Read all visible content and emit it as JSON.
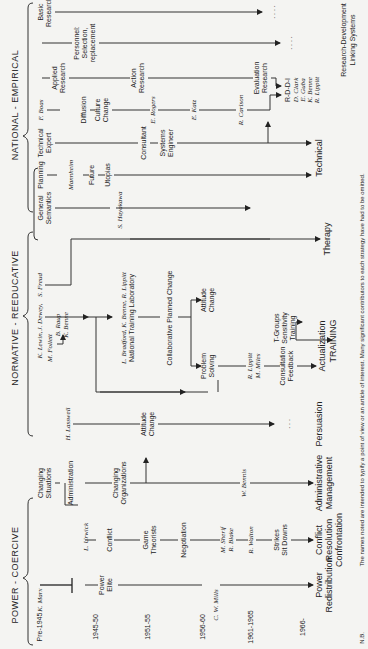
{
  "headings": {
    "power": "POWER - COERCIVE",
    "normative": "NORMATIVE - REEDUCATIVE",
    "national": "NATIONAL - EMPIRICAL"
  },
  "periods": [
    "Pre-1945",
    "1945-50",
    "1951-55",
    "1956-60",
    "1961-1965",
    "1966-"
  ],
  "power_coercive": {
    "k_marx": "K. Marx",
    "power_elite": [
      "Power",
      "Elite"
    ],
    "c_w_mills": "C. W. Mills",
    "power_redistribution": [
      "Power",
      "Redistribution"
    ],
    "conflict": "Conflict",
    "l_urwick": "L. Urwick",
    "game_theorists": [
      "Game",
      "Theorists"
    ],
    "negotiation": "Negotiation",
    "m_sherif": "M. Sherif",
    "r_blake": "R. Blake",
    "r_walton": "R. Walton",
    "strikes": [
      "Strikes",
      "Sit Downs"
    ],
    "conflict_resolution": [
      "Conflict",
      "Resolution",
      "Confrontation"
    ],
    "changing_situations": [
      "Changing",
      "Situations"
    ],
    "administration": "Administration",
    "changing_organizations": [
      "Changing",
      "Organizations"
    ],
    "w_bennis": "W. Bennis",
    "administrative_management": [
      "Administrative",
      "Management"
    ],
    "h_lasswell": "H. Lasswell",
    "attitude_change": [
      "Attitude",
      "Change"
    ],
    "persuasion": "Persuasion",
    "ellipsis": ". . ."
  },
  "normative_reeducative": {
    "k_lewin": "K. Lewin,",
    "j_dewey": "J. Dewey,",
    "s_freud": "S. Freud",
    "m_follett": "M. Follett",
    "b_raup": "B. Raup",
    "k_benne": "K. Benne",
    "ntl_names": "L. Bradford, K. Benne, R. Lippitt",
    "ntl": "National Training Laboratory",
    "collaborative": "Collaborative Planned Change",
    "attitude_change": [
      "Attitude",
      "Change"
    ],
    "problem_solving": [
      "Problem",
      "Solving"
    ],
    "r_lippitt": "R. Lippitt",
    "m_miles": "M. Miles",
    "consultation": [
      "Consultation",
      "Feedback"
    ],
    "t_groups": [
      "T-Groups",
      "Sensitivity",
      "Training"
    ],
    "actualization": "Actualization",
    "training": "TRAINING",
    "therapy": "Therapy"
  },
  "national_empirical": {
    "general_semantics": [
      "General",
      "Semantics"
    ],
    "s_hayakawa": "S. Hayakawa",
    "planning": "Planning",
    "mannheim": "Mannheim",
    "future": "Future",
    "utopias": "Utopias",
    "technical_expert": [
      "Technical",
      "Expert"
    ],
    "consultant": "Consultant",
    "systems_engineer": [
      "Systems",
      "Engineer"
    ],
    "technical": "Technical",
    "f_boas": "F. Boas",
    "diffusion": "Diffusion",
    "culture_change": [
      "Culture",
      "Change"
    ],
    "e_rogers": "E. Rogers",
    "e_katz": "E. Katz",
    "r_carlson": "R. Carlson",
    "evaluation_research": [
      "Evaluation",
      "Research"
    ],
    "applied_research": [
      "Applied",
      "Research"
    ],
    "action_research": [
      "Action",
      "Research"
    ],
    "rddi": "R-D-D-I",
    "rddi_names": [
      "D. Clark",
      "E. Guba",
      "K. Benne",
      "R. Lippitt"
    ],
    "personnel": [
      "Personnel:",
      "Selection,",
      "replacement"
    ],
    "basic_research": [
      "Basic",
      "Research"
    ],
    "rd_linking": [
      "Research-Development",
      "Linking Systems"
    ],
    "ellipsis": ". . . ."
  },
  "footnote": {
    "prefix": "N.B.",
    "text": "The names noted are intended to typify a point of view or an article of interest. Many significant contributors to each strategy have had to be omitted."
  }
}
